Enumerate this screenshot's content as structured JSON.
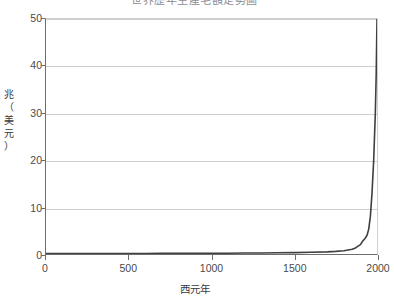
{
  "chart_data": {
    "type": "line",
    "title": "世界歷年生產毛額走勢圖",
    "xlabel": "西元年",
    "ylabel": "兆（美元）",
    "ylabel_chars": [
      "兆",
      "（",
      "美",
      "元",
      "）"
    ],
    "xlim": [
      0,
      2000
    ],
    "ylim": [
      0,
      50
    ],
    "xticks": [
      0,
      500,
      1000,
      1500,
      2000
    ],
    "xtick_labels": [
      "0",
      "500",
      "1000",
      "1500",
      "2000"
    ],
    "yticks": [
      0,
      10,
      20,
      30,
      40,
      50
    ],
    "ytick_labels": [
      "0",
      "10",
      "20",
      "30",
      "40",
      "50"
    ],
    "grid": "horizontal",
    "legend": "none",
    "series": [
      {
        "name": "世界生產毛額",
        "color": "#3f3f3f",
        "x": [
          0,
          100,
          200,
          300,
          400,
          500,
          600,
          700,
          800,
          900,
          1000,
          1100,
          1200,
          1300,
          1400,
          1500,
          1600,
          1700,
          1750,
          1800,
          1850,
          1870,
          1900,
          1913,
          1930,
          1940,
          1950,
          1960,
          1970,
          1980,
          1990,
          1995,
          2000
        ],
        "y": [
          0.1,
          0.1,
          0.11,
          0.11,
          0.11,
          0.12,
          0.12,
          0.13,
          0.13,
          0.14,
          0.15,
          0.17,
          0.2,
          0.22,
          0.25,
          0.3,
          0.37,
          0.45,
          0.55,
          0.7,
          1.0,
          1.3,
          2.0,
          2.7,
          3.4,
          4.0,
          5.3,
          8.0,
          13.0,
          20.0,
          30.0,
          38.0,
          50.0
        ]
      }
    ]
  },
  "axes": {
    "y_tick_positions_pct": [
      0,
      20,
      40,
      60,
      80,
      100
    ],
    "x_tick_positions_pct": [
      0,
      25,
      50,
      75,
      100
    ]
  },
  "colors": {
    "background": "#ffffff",
    "gridline": "#cfcfcf",
    "axis": "#6e6e6e",
    "curve": "#3f3f3f",
    "tick_text": "#4a4a4a",
    "title_text": "#8d8d94"
  }
}
